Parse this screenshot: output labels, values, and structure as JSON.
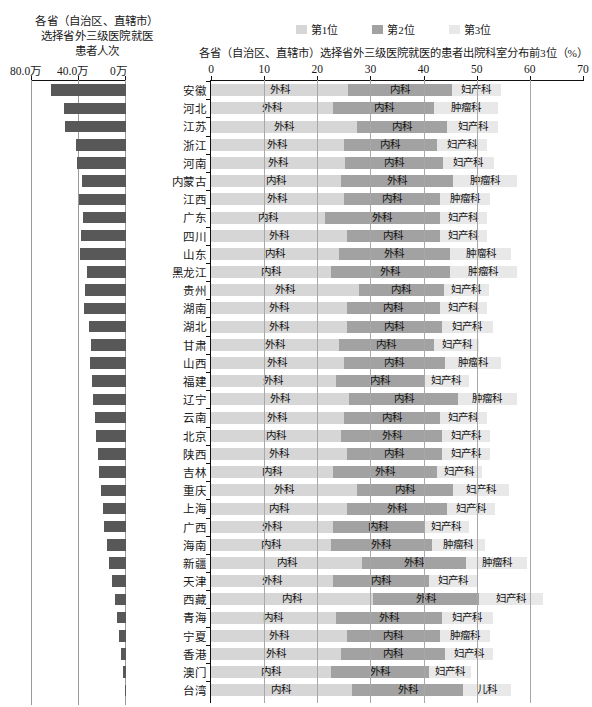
{
  "left": {
    "title": "各省（自治区、直辖市）\n选择省外三级医院就医\n患者人次",
    "title_line1": "各省（自治区、直辖市）",
    "title_line2": "选择省外三级医院就医",
    "title_line3": "患者人次",
    "axis_ticks": [
      "80.0万",
      "40.0万",
      "0万"
    ]
  },
  "legend": {
    "items": [
      {
        "label": "第1位",
        "color": "#d6d6d6"
      },
      {
        "label": "第2位",
        "color": "#a2a2a2"
      },
      {
        "label": "第3位",
        "color": "#e8e8e8"
      }
    ]
  },
  "right": {
    "title": "各省（自治区、直辖市）选择省外三级医院就医的患者出院科室分布前3位（%）",
    "axis_ticks": [
      "0",
      "10",
      "20",
      "30",
      "40",
      "50",
      "60",
      "70"
    ]
  },
  "chart_data": {
    "type": "bar",
    "title": "各省（自治区、直辖市）选择省外三级医院就医的患者出院科室分布前3位（%）",
    "left_title": "各省（自治区、直辖市）选择省外三级医院就医患者人次",
    "xlabel": "",
    "ylabel": "",
    "xlim": [
      0,
      70
    ],
    "left_xlim": [
      0,
      80
    ],
    "left_unit": "万",
    "grid": true,
    "legend_position": "top-center",
    "legend": [
      "第1位",
      "第2位",
      "第3位"
    ],
    "categories": [
      "安徽",
      "河北",
      "江苏",
      "浙江",
      "河南",
      "内蒙古",
      "江西",
      "广东",
      "四川",
      "山东",
      "黑龙江",
      "贵州",
      "湖南",
      "湖北",
      "甘肃",
      "山西",
      "福建",
      "辽宁",
      "云南",
      "北京",
      "陕西",
      "吉林",
      "重庆",
      "上海",
      "广西",
      "海南",
      "新疆",
      "天津",
      "西藏",
      "青海",
      "宁夏",
      "香港",
      "澳门",
      "台湾"
    ],
    "left_values": [
      63.0,
      52.5,
      51.5,
      42.5,
      41.5,
      37.0,
      39.5,
      36.5,
      38.0,
      38.5,
      33.0,
      34.5,
      35.5,
      31.0,
      29.5,
      30.5,
      29.0,
      27.5,
      26.5,
      25.5,
      24.0,
      22.5,
      21.0,
      19.5,
      18.5,
      16.0,
      14.5,
      12.0,
      9.5,
      7.5,
      5.5,
      4.0,
      2.5,
      1.2
    ],
    "series": [
      {
        "name": "第1位",
        "departments": [
          "外科",
          "外科",
          "外科",
          "外科",
          "外科",
          "内科",
          "外科",
          "内科",
          "外科",
          "内科",
          "内科",
          "外科",
          "外科",
          "外科",
          "外科",
          "外科",
          "外科",
          "外科",
          "外科",
          "内科",
          "外科",
          "内科",
          "外科",
          "内科",
          "外科",
          "内科",
          "内科",
          "外科",
          "内科",
          "内科",
          "外科",
          "外科",
          "内科",
          "内科"
        ],
        "values": [
          25.8,
          23.0,
          27.5,
          25.0,
          25.2,
          24.5,
          25.0,
          21.5,
          25.5,
          24.0,
          22.5,
          27.8,
          25.5,
          25.5,
          24.0,
          25.0,
          23.5,
          26.0,
          25.0,
          24.5,
          25.5,
          23.0,
          27.5,
          25.5,
          23.0,
          22.5,
          28.5,
          23.0,
          30.5,
          23.5,
          25.5,
          24.5,
          22.5,
          26.5
        ]
      },
      {
        "name": "第2位",
        "departments": [
          "内科",
          "内科",
          "内科",
          "内科",
          "内科",
          "外科",
          "内科",
          "外科",
          "内科",
          "外科",
          "外科",
          "内科",
          "内科",
          "内科",
          "内科",
          "内科",
          "内科",
          "内科",
          "内科",
          "外科",
          "内科",
          "外科",
          "内科",
          "外科",
          "内科",
          "外科",
          "外科",
          "内科",
          "外科",
          "外科",
          "内科",
          "内科",
          "外科",
          "外科"
        ],
        "values": [
          19.5,
          19.0,
          17.0,
          17.5,
          18.5,
          21.0,
          18.0,
          21.5,
          17.5,
          21.0,
          22.5,
          16.0,
          17.5,
          18.0,
          18.0,
          19.0,
          16.5,
          20.5,
          18.0,
          19.0,
          18.0,
          19.5,
          18.0,
          19.0,
          17.0,
          19.0,
          19.5,
          18.0,
          20.0,
          20.0,
          17.5,
          19.5,
          18.5,
          21.0
        ]
      },
      {
        "name": "第3位",
        "departments": [
          "妇产科",
          "肿瘤科",
          "妇产科",
          "妇产科",
          "妇产科",
          "肿瘤科",
          "肿瘤科",
          "妇产科",
          "妇产科",
          "肿瘤科",
          "肿瘤科",
          "妇产科",
          "妇产科",
          "妇产科",
          "妇产科",
          "肿瘤科",
          "妇产科",
          "肿瘤科",
          "妇产科",
          "妇产科",
          "妇产科",
          "妇产科",
          "妇产科",
          "妇产科",
          "妇产科",
          "肿瘤科",
          "肿瘤科",
          "妇产科",
          "妇产科",
          "妇产科",
          "肿瘤科",
          "妇产科",
          "妇产科",
          "儿科"
        ],
        "values": [
          9.2,
          12.0,
          9.5,
          9.5,
          9.5,
          12.0,
          9.5,
          9.0,
          9.0,
          11.5,
          12.5,
          8.5,
          9.0,
          9.5,
          8.5,
          10.5,
          8.5,
          11.0,
          9.0,
          9.0,
          9.0,
          8.5,
          10.5,
          9.0,
          8.5,
          10.0,
          11.5,
          9.0,
          12.0,
          9.5,
          9.5,
          9.0,
          8.0,
          9.0
        ]
      }
    ]
  }
}
